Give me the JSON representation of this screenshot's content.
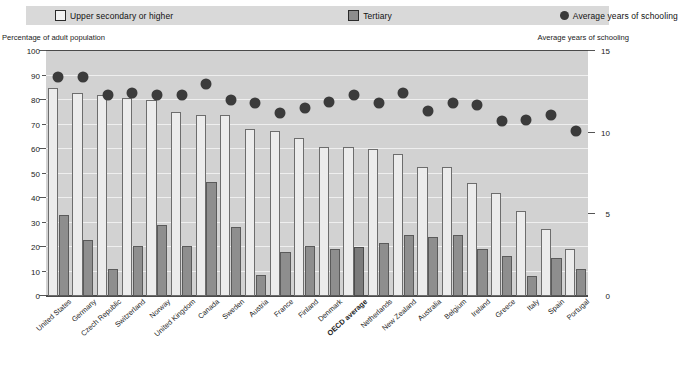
{
  "legend": {
    "items": [
      {
        "label": "Upper secondary or higher",
        "icon": "open-square-icon",
        "color": "#f2f2f2"
      },
      {
        "label": "Tertiary",
        "icon": "filled-square-icon",
        "color": "#8c8c8c"
      },
      {
        "label": "Average years of schooling",
        "icon": "filled-circle-icon",
        "color": "#3a3a3a"
      }
    ]
  },
  "axis_captions": {
    "left": "Percentage of adult population",
    "right": "Average years of schooling"
  },
  "chart_data": {
    "type": "bar",
    "title": "",
    "xlabel": "",
    "ylabel": "Percentage of adult population",
    "y2label": "Average years of schooling",
    "ylim": [
      0,
      100
    ],
    "y2lim": [
      0,
      15
    ],
    "yticks": [
      0,
      10,
      20,
      30,
      40,
      50,
      60,
      70,
      80,
      90,
      100
    ],
    "y2ticks": [
      0,
      5,
      10,
      15
    ],
    "grid": true,
    "legend_position": "top",
    "highlight_category": "OECD average",
    "categories": [
      "United States",
      "Germany",
      "Czech Republic",
      "Switzerland",
      "Norway",
      "United Kingdom",
      "Canada",
      "Sweden",
      "Austria",
      "France",
      "Finland",
      "Denmark",
      "OECD average",
      "Netherlands",
      "New Zealand",
      "Australia",
      "Belgium",
      "Ireland",
      "Greece",
      "Italy",
      "Spain",
      "Portugal"
    ],
    "series": [
      {
        "name": "Upper secondary or higher",
        "axis": "left",
        "unit": "%",
        "values": [
          85,
          83,
          82,
          81,
          80,
          75,
          74,
          74,
          68,
          67.5,
          64.5,
          61,
          61,
          60,
          58,
          52.5,
          52.5,
          46,
          42,
          34.5,
          27.5,
          19
        ]
      },
      {
        "name": "Tertiary",
        "axis": "left",
        "unit": "%",
        "values": [
          33,
          23,
          11,
          20.5,
          29,
          20.5,
          46.5,
          28,
          8.5,
          18,
          20.5,
          19,
          20,
          21.5,
          25,
          24,
          25,
          19,
          16.5,
          8,
          15.5,
          11
        ]
      },
      {
        "name": "Average years of schooling",
        "axis": "right",
        "unit": "years",
        "values": [
          13.4,
          13.4,
          12.3,
          12.4,
          12.3,
          12.3,
          13.0,
          12.0,
          11.8,
          11.2,
          11.5,
          11.9,
          12.3,
          11.8,
          12.4,
          11.3,
          11.8,
          11.7,
          10.7,
          10.8,
          11.1,
          10.1
        ]
      }
    ]
  },
  "colors": {
    "plot_background": "#d2d2d2",
    "legend_background": "#d9d9d9",
    "upper_secondary_fill": "#ececec",
    "tertiary_fill": "#8e8e8e",
    "tertiary_accent_fill": "#7b7b7b",
    "dot_fill": "#3b3b3b",
    "gridline": "#efefef",
    "axis": "#4a4a4a"
  }
}
